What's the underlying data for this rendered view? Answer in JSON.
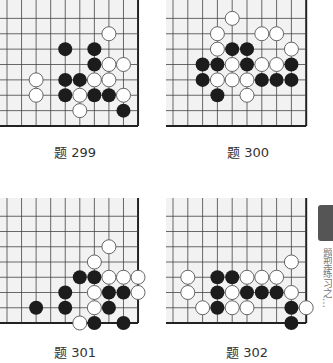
{
  "colors": {
    "board_bg": "#f2f2f2",
    "grid_line": "#444444",
    "edge_line": "#222222",
    "black_stone": "#1c1c1c",
    "white_stone": "#ffffff",
    "white_stone_border": "#555555"
  },
  "problems": [
    {
      "id": "299",
      "label": "题 299",
      "board": {
        "left": 7,
        "top": 3,
        "cols": 10,
        "rows": 9,
        "dx": 14.56,
        "dy": 15.375,
        "edge_right": true,
        "edge_bottom": true
      },
      "stones": [
        {
          "c": "W",
          "x": 7,
          "y": 2
        },
        {
          "c": "B",
          "x": 4,
          "y": 3
        },
        {
          "c": "B",
          "x": 6,
          "y": 3
        },
        {
          "c": "B",
          "x": 6,
          "y": 4
        },
        {
          "c": "W",
          "x": 7,
          "y": 4
        },
        {
          "c": "W",
          "x": 8,
          "y": 4
        },
        {
          "c": "W",
          "x": 2,
          "y": 5
        },
        {
          "c": "B",
          "x": 4,
          "y": 5
        },
        {
          "c": "B",
          "x": 5,
          "y": 5
        },
        {
          "c": "W",
          "x": 6,
          "y": 5
        },
        {
          "c": "W",
          "x": 7,
          "y": 5
        },
        {
          "c": "W",
          "x": 2,
          "y": 6
        },
        {
          "c": "B",
          "x": 4,
          "y": 6
        },
        {
          "c": "W",
          "x": 5,
          "y": 6
        },
        {
          "c": "B",
          "x": 6,
          "y": 6
        },
        {
          "c": "B",
          "x": 7,
          "y": 6
        },
        {
          "c": "W",
          "x": 8,
          "y": 6
        },
        {
          "c": "W",
          "x": 5,
          "y": 7
        },
        {
          "c": "B",
          "x": 8,
          "y": 7
        }
      ],
      "caption_pos": {
        "left": 35,
        "top": 145
      }
    },
    {
      "id": "300",
      "label": "题 300",
      "board": {
        "left": 173,
        "top": 3,
        "cols": 10,
        "rows": 9,
        "dx": 14.8,
        "dy": 15.375,
        "edge_right": true,
        "edge_bottom": true
      },
      "stones": [
        {
          "c": "W",
          "x": 4,
          "y": 1
        },
        {
          "c": "W",
          "x": 3,
          "y": 2
        },
        {
          "c": "W",
          "x": 6,
          "y": 2
        },
        {
          "c": "W",
          "x": 7,
          "y": 2
        },
        {
          "c": "W",
          "x": 3,
          "y": 3
        },
        {
          "c": "B",
          "x": 4,
          "y": 3
        },
        {
          "c": "B",
          "x": 5,
          "y": 3
        },
        {
          "c": "W",
          "x": 8,
          "y": 3
        },
        {
          "c": "B",
          "x": 2,
          "y": 4
        },
        {
          "c": "B",
          "x": 3,
          "y": 4
        },
        {
          "c": "W",
          "x": 4,
          "y": 4
        },
        {
          "c": "B",
          "x": 5,
          "y": 4
        },
        {
          "c": "W",
          "x": 6,
          "y": 4
        },
        {
          "c": "W",
          "x": 7,
          "y": 4
        },
        {
          "c": "B",
          "x": 8,
          "y": 4
        },
        {
          "c": "B",
          "x": 2,
          "y": 5
        },
        {
          "c": "W",
          "x": 3,
          "y": 5
        },
        {
          "c": "W",
          "x": 4,
          "y": 5
        },
        {
          "c": "W",
          "x": 5,
          "y": 5
        },
        {
          "c": "B",
          "x": 6,
          "y": 5
        },
        {
          "c": "B",
          "x": 7,
          "y": 5
        },
        {
          "c": "B",
          "x": 8,
          "y": 5
        },
        {
          "c": "B",
          "x": 3,
          "y": 6
        },
        {
          "c": "W",
          "x": 5,
          "y": 6
        }
      ],
      "caption_pos": {
        "left": 208,
        "top": 145
      }
    },
    {
      "id": "301",
      "label": "题 301",
      "board": {
        "left": 7,
        "top": 201,
        "cols": 10,
        "rows": 9,
        "dx": 14.56,
        "dy": 15.25,
        "edge_right": true,
        "edge_bottom": true
      },
      "stones": [
        {
          "c": "W",
          "x": 7,
          "y": 3
        },
        {
          "c": "W",
          "x": 6,
          "y": 4
        },
        {
          "c": "B",
          "x": 5,
          "y": 5
        },
        {
          "c": "B",
          "x": 6,
          "y": 5
        },
        {
          "c": "W",
          "x": 7,
          "y": 5
        },
        {
          "c": "W",
          "x": 8,
          "y": 5
        },
        {
          "c": "W",
          "x": 9,
          "y": 5
        },
        {
          "c": "B",
          "x": 4,
          "y": 6
        },
        {
          "c": "W",
          "x": 6,
          "y": 6
        },
        {
          "c": "B",
          "x": 7,
          "y": 6
        },
        {
          "c": "B",
          "x": 8,
          "y": 6
        },
        {
          "c": "W",
          "x": 9,
          "y": 6
        },
        {
          "c": "B",
          "x": 2,
          "y": 7
        },
        {
          "c": "B",
          "x": 4,
          "y": 7
        },
        {
          "c": "W",
          "x": 6,
          "y": 7
        },
        {
          "c": "B",
          "x": 7,
          "y": 7
        },
        {
          "c": "W",
          "x": 5,
          "y": 8
        },
        {
          "c": "B",
          "x": 6,
          "y": 8
        },
        {
          "c": "B",
          "x": 8,
          "y": 8
        }
      ],
      "caption_pos": {
        "left": 35,
        "top": 345
      }
    },
    {
      "id": "302",
      "label": "题 302",
      "board": {
        "left": 173,
        "top": 201,
        "cols": 10,
        "rows": 9,
        "dx": 14.8,
        "dy": 15.25,
        "edge_right": true,
        "edge_bottom": true
      },
      "stones": [
        {
          "c": "W",
          "x": 8,
          "y": 4
        },
        {
          "c": "W",
          "x": 1,
          "y": 5
        },
        {
          "c": "B",
          "x": 3,
          "y": 5
        },
        {
          "c": "B",
          "x": 4,
          "y": 5
        },
        {
          "c": "W",
          "x": 5,
          "y": 5
        },
        {
          "c": "W",
          "x": 6,
          "y": 5
        },
        {
          "c": "W",
          "x": 7,
          "y": 5
        },
        {
          "c": "W",
          "x": 1,
          "y": 6
        },
        {
          "c": "B",
          "x": 3,
          "y": 6
        },
        {
          "c": "W",
          "x": 4,
          "y": 6
        },
        {
          "c": "B",
          "x": 5,
          "y": 6
        },
        {
          "c": "B",
          "x": 6,
          "y": 6
        },
        {
          "c": "B",
          "x": 7,
          "y": 6
        },
        {
          "c": "W",
          "x": 8,
          "y": 6
        },
        {
          "c": "W",
          "x": 2,
          "y": 7
        },
        {
          "c": "B",
          "x": 3,
          "y": 7
        },
        {
          "c": "W",
          "x": 4,
          "y": 7
        },
        {
          "c": "W",
          "x": 5,
          "y": 7
        },
        {
          "c": "B",
          "x": 8,
          "y": 7
        },
        {
          "c": "W",
          "x": 9,
          "y": 7
        },
        {
          "c": "B",
          "x": 8,
          "y": 8
        }
      ],
      "caption_pos": {
        "left": 207,
        "top": 345
      }
    }
  ],
  "side_tab": {
    "text": "题型练习之…"
  }
}
